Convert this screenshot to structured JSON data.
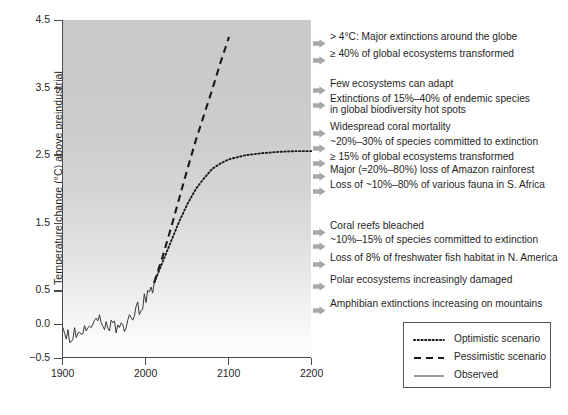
{
  "chart_data": {
    "type": "line",
    "title": "",
    "xlabel": "",
    "ylabel": "Temperature change (°C) above preindustrial",
    "xlim": [
      1900,
      2200
    ],
    "ylim": [
      -0.5,
      4.5
    ],
    "grid": false,
    "legend_position": "bottom-right",
    "x_ticks": [
      {
        "value": 1900,
        "label": "1900"
      },
      {
        "value": 2000,
        "label": "2000"
      },
      {
        "value": 2100,
        "label": "2100"
      },
      {
        "value": 2200,
        "label": "2200"
      }
    ],
    "y_ticks": [
      {
        "value": -0.5,
        "label": "−0.5"
      },
      {
        "value": 0.0,
        "label": "0.0"
      },
      {
        "value": 0.5,
        "label": "0.5"
      },
      {
        "value": 1.5,
        "label": "1.5"
      },
      {
        "value": 2.5,
        "label": "2.5"
      },
      {
        "value": 3.5,
        "label": "3.5"
      },
      {
        "value": 4.5,
        "label": "4.5"
      }
    ],
    "series": [
      {
        "name": "Observed",
        "style": "solid",
        "color": "#3a3a3a",
        "x": [
          1900,
          1902,
          1904,
          1906,
          1908,
          1910,
          1912,
          1914,
          1916,
          1918,
          1920,
          1922,
          1924,
          1926,
          1928,
          1930,
          1932,
          1934,
          1936,
          1938,
          1940,
          1942,
          1944,
          1946,
          1948,
          1950,
          1952,
          1954,
          1956,
          1958,
          1960,
          1962,
          1964,
          1966,
          1968,
          1970,
          1972,
          1974,
          1976,
          1978,
          1980,
          1982,
          1984,
          1986,
          1988,
          1990,
          1992,
          1994,
          1996,
          1998,
          2000,
          2002,
          2004,
          2006,
          2008,
          2010
        ],
        "values": [
          -0.05,
          -0.14,
          -0.22,
          -0.08,
          -0.27,
          -0.26,
          -0.22,
          -0.05,
          -0.2,
          -0.13,
          -0.12,
          -0.15,
          -0.14,
          -0.02,
          -0.1,
          -0.05,
          -0.03,
          -0.05,
          0.0,
          0.06,
          0.09,
          0.05,
          0.14,
          0.02,
          -0.03,
          -0.08,
          0.04,
          -0.06,
          -0.1,
          0.06,
          0.02,
          0.05,
          -0.13,
          -0.01,
          -0.05,
          0.02,
          0.0,
          -0.11,
          -0.06,
          0.06,
          0.14,
          0.1,
          0.06,
          0.12,
          0.26,
          0.33,
          0.14,
          0.2,
          0.22,
          0.45,
          0.32,
          0.5,
          0.48,
          0.55,
          0.46,
          0.62
        ]
      },
      {
        "name": "Pessimistic scenario",
        "style": "dashed",
        "color": "#1a1a1a",
        "x": [
          2010,
          2020,
          2030,
          2040,
          2050,
          2060,
          2070,
          2080,
          2090,
          2100
        ],
        "values": [
          0.62,
          1.0,
          1.42,
          1.86,
          2.3,
          2.72,
          3.1,
          3.48,
          3.88,
          4.25
        ]
      },
      {
        "name": "Optimistic scenario",
        "style": "dotted",
        "color": "#1a1a1a",
        "x": [
          2010,
          2020,
          2030,
          2040,
          2050,
          2060,
          2070,
          2080,
          2090,
          2100,
          2120,
          2140,
          2160,
          2180,
          2200
        ],
        "values": [
          0.62,
          0.92,
          1.22,
          1.52,
          1.78,
          2.0,
          2.16,
          2.3,
          2.38,
          2.44,
          2.5,
          2.53,
          2.55,
          2.56,
          2.56
        ]
      }
    ],
    "annotations": [
      {
        "marker": "arrow-marker",
        "temperature": 4.25,
        "lines": [
          "> 4°C: Major extinctions around the globe"
        ]
      },
      {
        "marker": "arrow-marker",
        "temperature": 4.0,
        "lines": [
          "≥ 40% of global ecosystems transformed"
        ]
      },
      {
        "marker": "arrow-marker",
        "temperature": 3.55,
        "lines": [
          "Few ecosystems can adapt"
        ]
      },
      {
        "marker": "arrow-marker",
        "temperature": 3.33,
        "lines": [
          "Extinctions of 15%–40% of endemic species",
          "in global biodiversity hot spots"
        ]
      },
      {
        "marker": "arrow-marker",
        "temperature": 2.92,
        "lines": [
          "Widespread coral mortality"
        ]
      },
      {
        "marker": "arrow-marker",
        "temperature": 2.7,
        "lines": [
          "~20%–30% of species committed to extinction"
        ]
      },
      {
        "marker": "arrow-marker",
        "temperature": 2.48,
        "lines": [
          "≥ 15% of global ecosystems transformed"
        ]
      },
      {
        "marker": "arrow-marker",
        "temperature": 2.28,
        "lines": [
          "Major (≈20%–80%) loss of Amazon rainforest"
        ]
      },
      {
        "marker": "arrow-marker",
        "temperature": 2.06,
        "lines": [
          "Loss of ~10%–80% of various fauna in S. Africa"
        ]
      },
      {
        "marker": "arrow-marker",
        "temperature": 1.45,
        "lines": [
          "Coral reefs bleached"
        ]
      },
      {
        "marker": "arrow-marker",
        "temperature": 1.25,
        "lines": [
          "~10%–15% of species committed to extinction"
        ]
      },
      {
        "marker": "arrow-marker",
        "temperature": 0.98,
        "lines": [
          "Loss of 8% of freshwater fish habitat in N. America"
        ]
      },
      {
        "marker": "arrow-marker",
        "temperature": 0.66,
        "lines": [
          "Polar ecosystems increasingly damaged"
        ]
      },
      {
        "marker": "arrow-marker",
        "temperature": 0.3,
        "lines": [
          "Amphibian extinctions increasing on mountains"
        ]
      }
    ],
    "legend": [
      {
        "label": "Optimistic scenario",
        "style": "dotted"
      },
      {
        "label": "Pessimistic scenario",
        "style": "dashed"
      },
      {
        "label": "Observed",
        "style": "solid"
      }
    ]
  },
  "colors": {
    "axis": "#4a4a4a",
    "text": "#1f1f1f",
    "marker": "#a8a8a8",
    "plot_top": "#c9c9c9",
    "plot_bottom": "#fdfdfd"
  }
}
